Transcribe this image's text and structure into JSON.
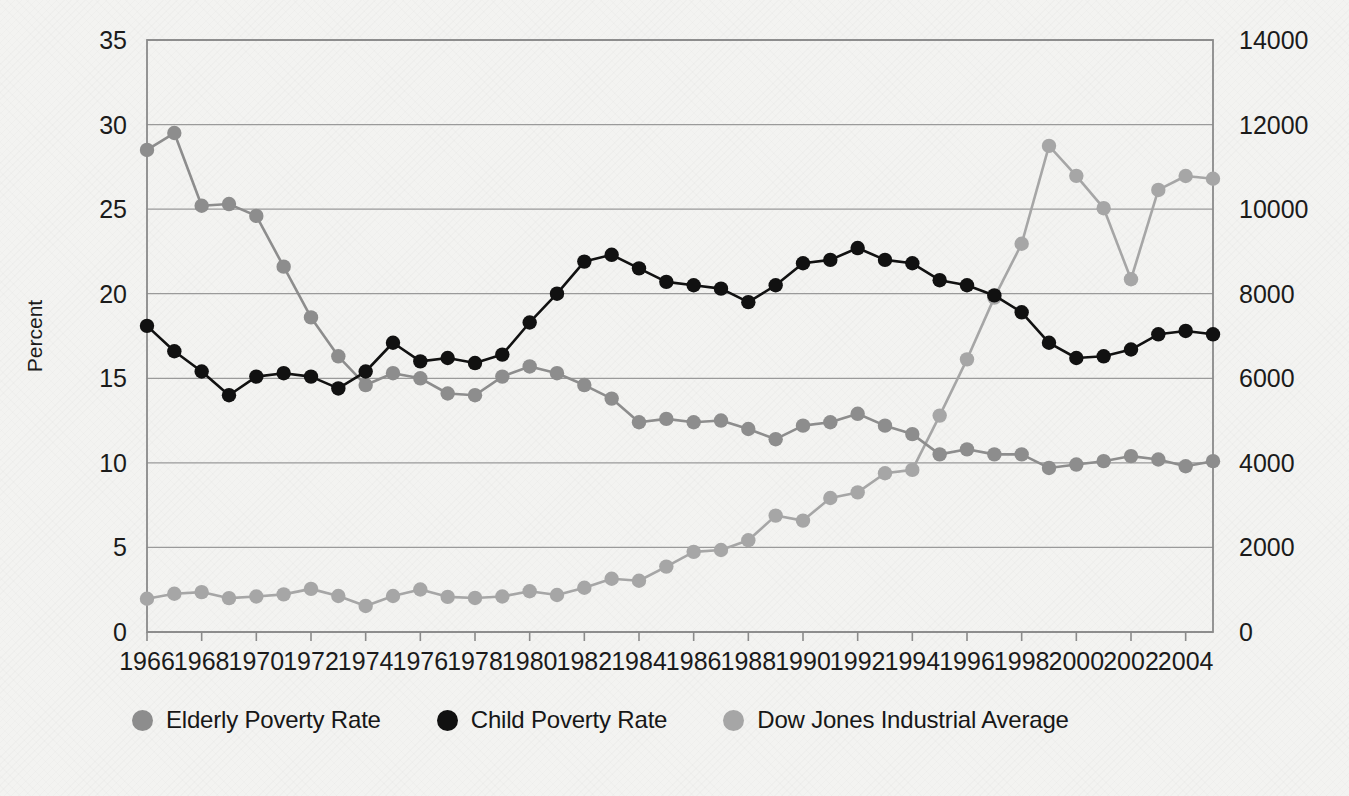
{
  "chart_data": {
    "type": "line",
    "title": "",
    "xlabel": "",
    "ylabel": "Percent",
    "y2label": "",
    "grid": true,
    "legend_position": "bottom",
    "x": [
      1966,
      1967,
      1968,
      1969,
      1970,
      1971,
      1972,
      1973,
      1974,
      1975,
      1976,
      1977,
      1978,
      1979,
      1980,
      1981,
      1982,
      1983,
      1984,
      1985,
      1986,
      1987,
      1988,
      1989,
      1990,
      1991,
      1992,
      1993,
      1994,
      1995,
      1996,
      1997,
      1998,
      1999,
      2000,
      2001,
      2002,
      2003,
      2004,
      2005
    ],
    "xtick_labels": [
      "1966",
      "1968",
      "1970",
      "1972",
      "1974",
      "1976",
      "1978",
      "1980",
      "1982",
      "1984",
      "1986",
      "1988",
      "1990",
      "1992",
      "1994",
      "1996",
      "1998",
      "2000",
      "2002",
      "2004"
    ],
    "ytick_labels": [
      "0",
      "5",
      "10",
      "15",
      "20",
      "25",
      "30",
      "35"
    ],
    "y2tick_labels": [
      "0",
      "2000",
      "4000",
      "6000",
      "8000",
      "10000",
      "12000",
      "14000"
    ],
    "ylim": [
      0,
      35
    ],
    "y2lim": [
      0,
      14000
    ],
    "xlim": [
      1966,
      2005
    ],
    "series": [
      {
        "name": "Elderly Poverty Rate",
        "axis": "left",
        "color": "#8d8d8d",
        "marker": "circle",
        "values": [
          28.5,
          29.5,
          25.2,
          25.3,
          24.6,
          21.6,
          18.6,
          16.3,
          14.6,
          15.3,
          15.0,
          14.1,
          14.0,
          15.1,
          15.7,
          15.3,
          14.6,
          13.8,
          12.4,
          12.6,
          12.4,
          12.5,
          12.0,
          11.4,
          12.2,
          12.4,
          12.9,
          12.2,
          11.7,
          10.5,
          10.8,
          10.5,
          10.5,
          9.7,
          9.9,
          10.1,
          10.4,
          10.2,
          9.8,
          10.1
        ]
      },
      {
        "name": "Child Poverty Rate",
        "axis": "left",
        "color": "#111111",
        "marker": "circle",
        "values": [
          18.1,
          16.6,
          15.4,
          14.0,
          15.1,
          15.3,
          15.1,
          14.4,
          15.4,
          17.1,
          16.0,
          16.2,
          15.9,
          16.4,
          18.3,
          20.0,
          21.9,
          22.3,
          21.5,
          20.7,
          20.5,
          20.3,
          19.5,
          20.5,
          21.8,
          22.0,
          22.7,
          22.0,
          21.8,
          20.8,
          20.5,
          19.9,
          18.9,
          17.1,
          16.2,
          16.3,
          16.7,
          17.6,
          17.8,
          17.6
        ]
      },
      {
        "name": "Dow Jones Industrial Average",
        "axis": "right",
        "color": "#a6a6a6",
        "marker": "circle",
        "values": [
          786,
          905,
          944,
          800,
          839,
          890,
          1020,
          851,
          616,
          852,
          1005,
          831,
          805,
          839,
          964,
          875,
          1047,
          1259,
          1212,
          1547,
          1896,
          1939,
          2169,
          2753,
          2634,
          3169,
          3301,
          3754,
          3834,
          5117,
          6448,
          7908,
          9181,
          11497,
          10787,
          10022,
          8342,
          10454,
          10783,
          10718
        ]
      }
    ]
  },
  "legend": {
    "entries": [
      {
        "label": "Elderly Poverty Rate",
        "color": "#8d8d8d"
      },
      {
        "label": "Child Poverty Rate",
        "color": "#111111"
      },
      {
        "label": "Dow Jones Industrial Average",
        "color": "#a6a6a6"
      }
    ]
  },
  "axes": {
    "left_title": "Percent"
  },
  "colors": {
    "plot_border": "#8a8a8a",
    "gridline": "#9a9a9a",
    "background": "#f3f3f1"
  }
}
